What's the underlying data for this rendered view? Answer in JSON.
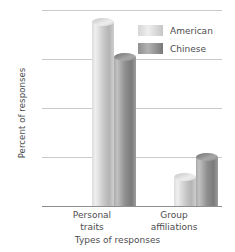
{
  "chart_data": {
    "type": "bar",
    "title": "",
    "xlabel": "Types of responses",
    "ylabel": "Percent of responses",
    "categories": [
      "Personal traits",
      "Group affiliations"
    ],
    "category_lines": [
      [
        "Personal",
        "traits"
      ],
      [
        "Group",
        "affiliations"
      ]
    ],
    "series": [
      {
        "name": "American",
        "values": [
          75,
          12
        ],
        "color": "#d8d8d8"
      },
      {
        "name": "Chinese",
        "values": [
          61,
          20
        ],
        "color": "#8f8f8f"
      }
    ],
    "ylim": [
      0,
      80
    ],
    "yticks": [
      0,
      20,
      40,
      60,
      80
    ],
    "ytick_labels": [
      "0",
      "20",
      "40",
      "60",
      "80"
    ],
    "grid": true,
    "legend_position": "top-right",
    "legend_entries": [
      "American",
      "Chinese"
    ]
  },
  "axis": {
    "y_title": "Percent of responses",
    "x_title": "Types of responses"
  }
}
